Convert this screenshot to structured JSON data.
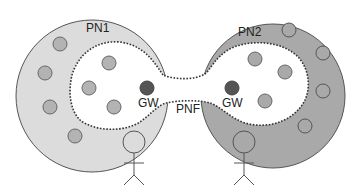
{
  "labels": {
    "pn1": "PN1",
    "pn2": "PN2",
    "pnf": "PNF",
    "gw_left": "GW",
    "gw_right": "GW"
  },
  "colors": {
    "pn1_ring": "#dcdcdc",
    "pn2_ring": "#a9a9a9",
    "node_fill": "#b3b3b3",
    "node_stroke": "#666666",
    "gateway_fill": "#555555",
    "outline": "#555555",
    "dotted_boundary": "#333333"
  },
  "networks": [
    {
      "id": "PN1",
      "label": "PN1",
      "ring_nodes": 5,
      "inner_nodes": 3,
      "gateway": "GW"
    },
    {
      "id": "PN2",
      "label": "PN2",
      "ring_nodes": 5,
      "inner_nodes": 3,
      "gateway": "GW"
    }
  ],
  "users": [
    {
      "id": "user-1",
      "attached_to": "PN1"
    },
    {
      "id": "user-2",
      "attached_to": "PN2"
    }
  ]
}
